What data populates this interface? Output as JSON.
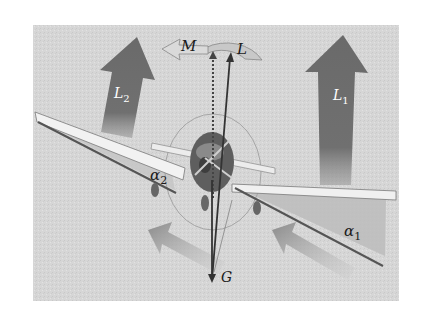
{
  "figure": {
    "colors": {
      "background": "#ffffff",
      "panel": "#d9d9d9",
      "lift_arrow": "#6e6e6e",
      "wing": "#efefef",
      "wing_edge": "#555555",
      "vector": "#333333",
      "flow_arrow": "#9a9a9a",
      "angle_fill": "#b8b8b8"
    },
    "labels": {
      "moment": "M",
      "total_lift": "L",
      "gravity": "G",
      "lift_left": "L",
      "lift_left_sub": "2",
      "lift_right": "L",
      "lift_right_sub": "1",
      "alpha_left": "α",
      "alpha_left_sub": "2",
      "alpha_right": "α",
      "alpha_right_sub": "1"
    }
  }
}
